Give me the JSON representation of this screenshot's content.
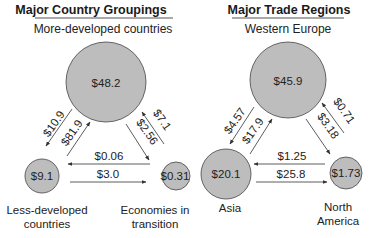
{
  "panels": [
    {
      "title": "Major Country Groupings",
      "top_node": {
        "label": "More-developed countries",
        "value": "$48.2"
      },
      "left_node": {
        "label_line1": "Less-developed",
        "label_line2": "countries",
        "value": "$9.1"
      },
      "right_node": {
        "label_line1": "Economies in",
        "label_line2": "transition",
        "value": "$0.31"
      },
      "flows": {
        "top_to_left": "$10.9",
        "left_to_top": "$81.9",
        "right_to_top": "$7.1",
        "top_to_right": "$2.56",
        "right_to_left": "$0.06",
        "left_to_right": "$3.0"
      }
    },
    {
      "title": "Major Trade Regions",
      "top_node": {
        "label": "Western Europe",
        "value": "$45.9"
      },
      "left_node": {
        "label_line1": "Asia",
        "label_line2": "",
        "value": "$20.1"
      },
      "right_node": {
        "label_line1": "North",
        "label_line2": "America",
        "value": "$1.73"
      },
      "flows": {
        "top_to_left": "$4.57",
        "left_to_top": "$17.9",
        "right_to_top": "$0.71",
        "top_to_right": "$3.18",
        "right_to_left": "$1.25",
        "left_to_right": "$25.8"
      }
    }
  ],
  "colors": {
    "node_fill": "#bdbdbd",
    "node_stroke": "#444444",
    "text": "#222222"
  }
}
